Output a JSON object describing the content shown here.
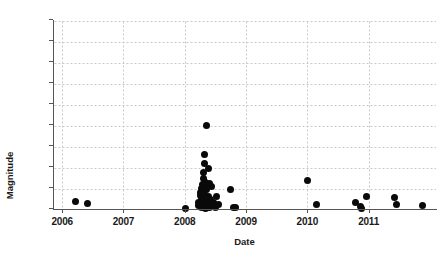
{
  "chart_data": {
    "type": "scatter",
    "title": "",
    "xlabel": "Date",
    "ylabel": "Magnitude",
    "xlim": [
      2005.85,
      2012.1
    ],
    "ylim": [
      3.0,
      7.5
    ],
    "grid": true,
    "legend": null,
    "marker": {
      "shape": "circle",
      "color": "#0a0a0a",
      "size": 7
    },
    "xticks": [
      2006,
      2007,
      2008,
      2009,
      2010,
      2011
    ],
    "xtick_labels": [
      "2006",
      "2007",
      "2008",
      "2009",
      "2010",
      "2011"
    ],
    "yticks": [
      3.0,
      3.5,
      4.0,
      4.5,
      5.0,
      5.5,
      6.0,
      6.5,
      7.0,
      7.5
    ],
    "ytick_labels": [
      "3.0",
      "3.5",
      "4.0",
      "4.5",
      "5.0",
      "5.5",
      "6.0",
      "6.5",
      "7.0",
      "7.5"
    ],
    "points": [
      {
        "x": 2006.21,
        "y": 3.21
      },
      {
        "x": 2006.41,
        "y": 3.16
      },
      {
        "x": 2008.02,
        "y": 3.03
      },
      {
        "x": 2008.22,
        "y": 3.1
      },
      {
        "x": 2008.23,
        "y": 3.17
      },
      {
        "x": 2008.25,
        "y": 3.34
      },
      {
        "x": 2008.26,
        "y": 3.42
      },
      {
        "x": 2008.27,
        "y": 3.07
      },
      {
        "x": 2008.28,
        "y": 3.25
      },
      {
        "x": 2008.28,
        "y": 3.52
      },
      {
        "x": 2008.29,
        "y": 3.12
      },
      {
        "x": 2008.29,
        "y": 3.6
      },
      {
        "x": 2008.3,
        "y": 3.05
      },
      {
        "x": 2008.3,
        "y": 3.3
      },
      {
        "x": 2008.3,
        "y": 3.75
      },
      {
        "x": 2008.31,
        "y": 3.2
      },
      {
        "x": 2008.31,
        "y": 3.45
      },
      {
        "x": 2008.31,
        "y": 3.9
      },
      {
        "x": 2008.32,
        "y": 3.08
      },
      {
        "x": 2008.32,
        "y": 3.38
      },
      {
        "x": 2008.32,
        "y": 4.1
      },
      {
        "x": 2008.33,
        "y": 3.15
      },
      {
        "x": 2008.33,
        "y": 3.55
      },
      {
        "x": 2008.33,
        "y": 4.32
      },
      {
        "x": 2008.34,
        "y": 3.04
      },
      {
        "x": 2008.34,
        "y": 3.28
      },
      {
        "x": 2008.34,
        "y": 3.65
      },
      {
        "x": 2008.35,
        "y": 3.18
      },
      {
        "x": 2008.35,
        "y": 5.01
      },
      {
        "x": 2008.36,
        "y": 3.06
      },
      {
        "x": 2008.36,
        "y": 3.48
      },
      {
        "x": 2008.37,
        "y": 3.22
      },
      {
        "x": 2008.37,
        "y": 3.58
      },
      {
        "x": 2008.38,
        "y": 3.09
      },
      {
        "x": 2008.38,
        "y": 4.0
      },
      {
        "x": 2008.39,
        "y": 3.33
      },
      {
        "x": 2008.4,
        "y": 3.13
      },
      {
        "x": 2008.4,
        "y": 3.63
      },
      {
        "x": 2008.41,
        "y": 3.05
      },
      {
        "x": 2008.42,
        "y": 3.26
      },
      {
        "x": 2008.43,
        "y": 3.11
      },
      {
        "x": 2008.44,
        "y": 3.57
      },
      {
        "x": 2008.45,
        "y": 3.08
      },
      {
        "x": 2008.47,
        "y": 3.19
      },
      {
        "x": 2008.5,
        "y": 3.07
      },
      {
        "x": 2008.52,
        "y": 3.31
      },
      {
        "x": 2008.55,
        "y": 3.14
      },
      {
        "x": 2008.74,
        "y": 3.48
      },
      {
        "x": 2008.79,
        "y": 3.07
      },
      {
        "x": 2008.83,
        "y": 3.06
      },
      {
        "x": 2010.0,
        "y": 3.71
      },
      {
        "x": 2010.15,
        "y": 3.13
      },
      {
        "x": 2010.78,
        "y": 3.18
      },
      {
        "x": 2010.86,
        "y": 3.08
      },
      {
        "x": 2010.88,
        "y": 3.03
      },
      {
        "x": 2010.97,
        "y": 3.31
      },
      {
        "x": 2011.42,
        "y": 3.29
      },
      {
        "x": 2011.46,
        "y": 3.13
      },
      {
        "x": 2011.88,
        "y": 3.11
      }
    ]
  },
  "colors": {
    "marker": "#0a0a0a",
    "grid": "#c9c9c9",
    "axis": "#555555",
    "text": "#1a1a1a",
    "background": "#ffffff"
  }
}
